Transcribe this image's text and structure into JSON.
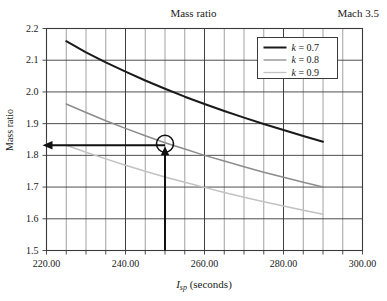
{
  "chart_data": {
    "type": "line",
    "title": "Mass ratio",
    "annotation_corner": "Mach 3.5",
    "xlabel": "I_sp (seconds)",
    "xlabel_parts": {
      "symbol": "I",
      "subscript": "sp",
      "units": "(seconds)"
    },
    "ylabel": "Mass ratio",
    "xlim": [
      220.0,
      300.0
    ],
    "ylim": [
      1.5,
      2.2
    ],
    "xticks": [
      220.0,
      240.0,
      260.0,
      280.0,
      300.0
    ],
    "xtick_labels": [
      "220.00",
      "240.00",
      "260.00",
      "280.00",
      "300.00"
    ],
    "yticks": [
      1.5,
      1.6,
      1.7,
      1.8,
      1.9,
      2.0,
      2.1,
      2.2
    ],
    "ytick_labels": [
      "1.5",
      "1.6",
      "1.7",
      "1.8",
      "1.9",
      "2.0",
      "2.1",
      "2.2"
    ],
    "x_minor_step": 5,
    "y_minor_step": 0.1,
    "grid": true,
    "legend_position": "top-right",
    "series": [
      {
        "name": "k = 0.7",
        "color": "#1a1a1a",
        "x": [
          225,
          230,
          235,
          240,
          245,
          250,
          255,
          260,
          265,
          270,
          275,
          280,
          285,
          290
        ],
        "y": [
          2.16,
          2.125,
          2.093,
          2.064,
          2.036,
          2.01,
          1.985,
          1.962,
          1.94,
          1.919,
          1.899,
          1.88,
          1.861,
          1.843
        ]
      },
      {
        "name": "k = 0.8",
        "color": "#8c8c8c",
        "x": [
          225,
          230,
          235,
          240,
          245,
          250,
          255,
          260,
          265,
          270,
          275,
          280,
          285,
          290
        ],
        "y": [
          1.962,
          1.935,
          1.909,
          1.885,
          1.862,
          1.84,
          1.82,
          1.8,
          1.782,
          1.764,
          1.747,
          1.731,
          1.715,
          1.7
        ]
      },
      {
        "name": "k = 0.9",
        "color": "#c2c2c2",
        "x": [
          225,
          230,
          235,
          240,
          245,
          250,
          255,
          260,
          265,
          270,
          275,
          280,
          285,
          290
        ],
        "y": [
          1.832,
          1.81,
          1.789,
          1.769,
          1.75,
          1.732,
          1.715,
          1.699,
          1.683,
          1.668,
          1.654,
          1.64,
          1.627,
          1.614
        ]
      }
    ],
    "legend_entries": [
      {
        "label": "k = 0.7",
        "symbol": "k",
        "value": "0.7",
        "color": "#1a1a1a"
      },
      {
        "label": "k = 0.8",
        "symbol": "k",
        "value": "0.8",
        "color": "#8c8c8c"
      },
      {
        "label": "k = 0.9",
        "symbol": "k",
        "value": "0.9",
        "color": "#c2c2c2"
      }
    ],
    "annotations": {
      "marker_circle": {
        "x": 250,
        "y": 1.832,
        "shape": "circle"
      },
      "vertical_arrow": {
        "x": 250,
        "from_y": 1.5,
        "to_y": 1.832,
        "direction": "up"
      },
      "horizontal_arrow": {
        "y": 1.832,
        "from_x": 250,
        "to_x": 220,
        "direction": "left"
      }
    }
  }
}
